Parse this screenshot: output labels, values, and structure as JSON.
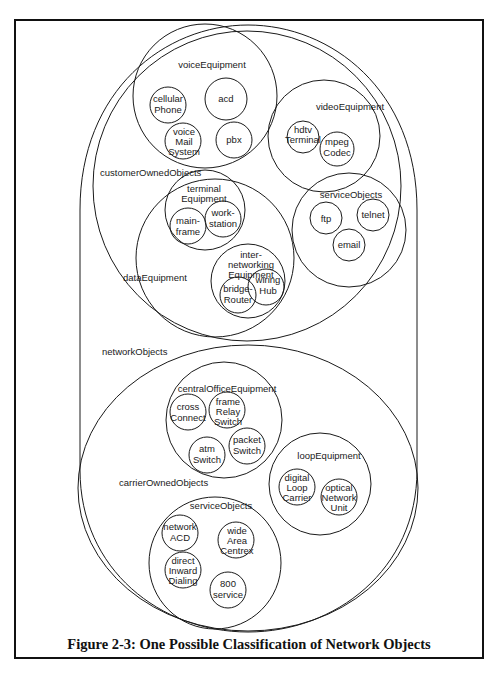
{
  "figure": {
    "caption": "Figure 2-3: One Possible Classification of Network Objects",
    "colors": {
      "line": "#1a1a1a",
      "background": "#ffffff",
      "frame": "#111111"
    }
  },
  "diagram": {
    "root": {
      "label": "networkObjects",
      "children": {
        "customerOwnedObjects": {
          "label": "customerOwnedObjects",
          "voiceEquipment": {
            "label": "voiceEquipment",
            "items": [
              [
                "cellular",
                "Phone"
              ],
              [
                "acd"
              ],
              [
                "voice",
                "Mail",
                "System"
              ],
              [
                "pbx"
              ]
            ]
          },
          "videoEquipment": {
            "label": "videoEquipment",
            "items": [
              [
                "hdtv",
                "Terminal"
              ],
              [
                "mpeg",
                "Codec"
              ]
            ]
          },
          "dataEquipment": {
            "label": "dataEquipment",
            "terminalEquipment": {
              "label": [
                "terminal",
                "Equipment"
              ],
              "items": [
                [
                  "main-",
                  "frame"
                ],
                [
                  "work-",
                  "station"
                ]
              ]
            },
            "internetworkingEquipment": {
              "label": [
                "inter-",
                "networking",
                "Equipment"
              ],
              "items": [
                [
                  "bridge-",
                  "Router"
                ],
                [
                  "wiring",
                  "Hub"
                ]
              ]
            }
          },
          "serviceObjects": {
            "label": "serviceObjects",
            "items": [
              [
                "ftp"
              ],
              [
                "telnet"
              ],
              [
                "email"
              ]
            ]
          }
        },
        "carrierOwnedObjects": {
          "label": "carrierOwnedObjects",
          "centralOfficeEquipment": {
            "label": "centralOfficeEquipment",
            "items": [
              [
                "cross",
                "Connect"
              ],
              [
                "frame",
                "Relay",
                "Switch"
              ],
              [
                "atm",
                "Switch"
              ],
              [
                "packet",
                "Switch"
              ]
            ]
          },
          "loopEquipment": {
            "label": "loopEquipment",
            "items": [
              [
                "digital",
                "Loop",
                "Carrier"
              ],
              [
                "optical",
                "Network",
                "Unit"
              ]
            ]
          },
          "serviceObjects": {
            "label": "serviceObjects",
            "items": [
              [
                "network",
                "ACD"
              ],
              [
                "wide",
                "Area",
                "Centrex"
              ],
              [
                "direct",
                "Inward",
                "Dialing"
              ],
              [
                "800",
                "service"
              ]
            ]
          }
        }
      }
    }
  }
}
